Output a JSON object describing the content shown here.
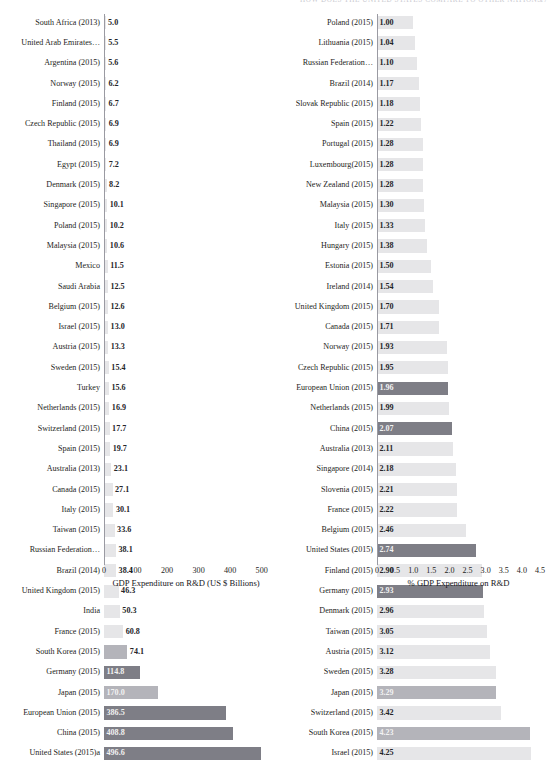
{
  "header": {
    "running_title": "HOW DOES THE UNITED STATES COMPARE TO OTHER NATIONS",
    "page_number": "17"
  },
  "chart_data": [
    {
      "id": "left",
      "type": "bar",
      "orientation": "horizontal",
      "title": "",
      "xlabel": "GDP Expenditure on R&D (US $ Billions)",
      "ylabel": "",
      "xlim": [
        0,
        520
      ],
      "xticks": [
        "0",
        "100",
        "200",
        "300",
        "400",
        "500"
      ],
      "xtick_values": [
        0,
        100,
        200,
        300,
        400,
        500
      ],
      "grid": false,
      "legend": "none",
      "categories": [
        "South Africa (2013)",
        "United Arab Emirates…",
        "Argentina (2015)",
        "Norway (2015)",
        "Finland (2015)",
        "Czech Republic (2015)",
        "Thailand (2015)",
        "Egypt (2015)",
        "Denmark (2015)",
        "Singapore (2015)",
        "Poland (2015)",
        "Malaysia (2015)",
        "Mexico",
        "Saudi Arabia",
        "Belgium (2015)",
        "Israel (2015)",
        "Austria (2015)",
        "Sweden (2015)",
        "Turkey",
        "Netherlands (2015)",
        "Switzerland (2015)",
        "Spain (2015)",
        "Australia (2013)",
        "Canada (2015)",
        "Italy (2015)",
        "Taiwan (2015)",
        "Russian Federation…",
        "Brazil (2014)",
        "United Kingdom (2015)",
        "India",
        "France (2015)",
        "South Korea (2015)",
        "Germany (2015)",
        "Japan (2015)",
        "European Union (2015)",
        "China (2015)",
        "United States (2015)a"
      ],
      "values": [
        5.0,
        5.5,
        5.6,
        6.2,
        6.7,
        6.9,
        6.9,
        7.2,
        8.2,
        10.1,
        10.2,
        10.6,
        11.5,
        12.5,
        12.6,
        13.0,
        13.3,
        15.4,
        15.6,
        16.9,
        17.7,
        19.7,
        23.1,
        27.1,
        30.1,
        33.6,
        38.1,
        38.4,
        46.3,
        50.3,
        60.8,
        74.1,
        114.8,
        170.0,
        386.5,
        408.8,
        496.6
      ],
      "value_labels": [
        "5.0",
        "5.5",
        "5.6",
        "6.2",
        "6.7",
        "6.9",
        "6.9",
        "7.2",
        "8.2",
        "10.1",
        "10.2",
        "10.6",
        "11.5",
        "12.5",
        "12.6",
        "13.0",
        "13.3",
        "15.4",
        "15.6",
        "16.9",
        "17.7",
        "19.7",
        "23.1",
        "27.1",
        "30.1",
        "33.6",
        "38.1",
        "38.4",
        "46.3",
        "50.3",
        "60.8",
        "74.1",
        "114.8",
        "170.0",
        "386.5",
        "408.8",
        "496.6"
      ],
      "highlight_indices": [
        32,
        34,
        35,
        36
      ],
      "mid_indices": [
        31,
        33
      ]
    },
    {
      "id": "right",
      "type": "bar",
      "orientation": "horizontal",
      "title": "",
      "xlabel": "% GDP Expenditure on R&D",
      "ylabel": "",
      "xlim": [
        0,
        4.5
      ],
      "xticks": [
        "0",
        "0.5",
        "1.0",
        "1.5",
        "2.0",
        "2.5",
        "3.0",
        "3.5",
        "4.0",
        "4.5"
      ],
      "xtick_values": [
        0,
        0.5,
        1.0,
        1.5,
        2.0,
        2.5,
        3.0,
        3.5,
        4.0,
        4.5
      ],
      "grid": false,
      "legend": "none",
      "categories": [
        "Poland (2015)",
        "Lithuania (2015)",
        "Russian Federation…",
        "Brazil (2014)",
        "Slovak Republic (2015)",
        "Spain (2015)",
        "Portugal (2015)",
        "Luxembourg(2015)",
        "New Zealand (2015)",
        "Malaysia (2015)",
        "Italy (2015)",
        "Hungary (2015)",
        "Estonia (2015)",
        "Ireland (2014)",
        "United Kingdom (2015)",
        "Canada (2015)",
        "Norway (2015)",
        "Czech Republic (2015)",
        "European Union (2015)",
        "Netherlands (2015)",
        "China (2015)",
        "Australia (2013)",
        "Singapore (2014)",
        "Slovenia (2015)",
        "France (2015)",
        "Belgium (2015)",
        "United States (2015)",
        "Finland (2015)",
        "Germany (2015)",
        "Denmark (2015)",
        "Taiwan (2015)",
        "Austria (2015)",
        "Sweden (2015)",
        "Japan (2015)",
        "Switzerland (2015)",
        "South Korea (2015)",
        "Israel (2015)"
      ],
      "values": [
        1.0,
        1.04,
        1.1,
        1.17,
        1.18,
        1.22,
        1.28,
        1.28,
        1.28,
        1.3,
        1.33,
        1.38,
        1.5,
        1.54,
        1.7,
        1.71,
        1.93,
        1.95,
        1.96,
        1.99,
        2.07,
        2.11,
        2.18,
        2.21,
        2.22,
        2.46,
        2.74,
        2.9,
        2.93,
        2.96,
        3.05,
        3.12,
        3.28,
        3.29,
        3.42,
        4.23,
        4.25
      ],
      "value_labels": [
        "1.00",
        "1.04",
        "1.10",
        "1.17",
        "1.18",
        "1.22",
        "1.28",
        "1.28",
        "1.28",
        "1.30",
        "1.33",
        "1.38",
        "1.50",
        "1.54",
        "1.70",
        "1.71",
        "1.93",
        "1.95",
        "1.96",
        "1.99",
        "2.07",
        "2.11",
        "2.18",
        "2.21",
        "2.22",
        "2.46",
        "2.74",
        "2.90",
        "2.93",
        "2.96",
        "3.05",
        "3.12",
        "3.28",
        "3.29",
        "3.42",
        "4.23",
        "4.25"
      ],
      "highlight_indices": [
        18,
        20,
        26,
        28
      ],
      "mid_indices": [
        33,
        35
      ]
    }
  ],
  "colors": {
    "bar_default": "#e6e6e8",
    "bar_mid": "#b4b4ba",
    "bar_highlight": "#7e7e86",
    "axis": "#9a9aa2",
    "text": "#1e1e22",
    "header_text": "#c9c9cf"
  }
}
